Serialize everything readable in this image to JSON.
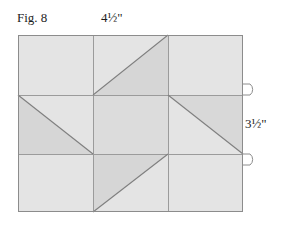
{
  "figure": {
    "caption": "Fig. 8",
    "top_dimension": "4½\"",
    "right_dimension": "3½\"",
    "type": "quilt-block-piecing-diagram"
  },
  "colors": {
    "outline": "#8a8a8a",
    "grid_line": "#9a9a9a",
    "diagonal_line": "#7d7d7d",
    "fill_light": "#e3e3e3",
    "fill_mid": "#dadada",
    "fill_dark": "#d2d2d2",
    "background": "#ffffff",
    "text": "#1c1c1c"
  },
  "geometry": {
    "block_left": 18,
    "block_top": 35,
    "block_right": 243,
    "block_bottom": 212,
    "v_grid": [
      93,
      168
    ],
    "h_grid": [
      95,
      154
    ],
    "tab_top_y": 95,
    "tab_bottom_y": 154
  },
  "grid": {
    "columns": 3,
    "rows": 3,
    "cells": [
      {
        "name": "cell-r1c1",
        "row": 1,
        "col": 1,
        "diagonal": "none",
        "shade": "light"
      },
      {
        "name": "cell-r1c2",
        "row": 1,
        "col": 2,
        "diagonal": "bl-tr",
        "shade": "split"
      },
      {
        "name": "cell-r1c3",
        "row": 1,
        "col": 3,
        "diagonal": "none",
        "shade": "light"
      },
      {
        "name": "cell-r2c1",
        "row": 2,
        "col": 1,
        "diagonal": "tl-br",
        "shade": "split"
      },
      {
        "name": "cell-r2c2",
        "row": 2,
        "col": 2,
        "diagonal": "none",
        "shade": "mid"
      },
      {
        "name": "cell-r2c3",
        "row": 2,
        "col": 3,
        "diagonal": "tl-br",
        "shade": "split"
      },
      {
        "name": "cell-r3c1",
        "row": 3,
        "col": 1,
        "diagonal": "none",
        "shade": "light"
      },
      {
        "name": "cell-r3c2",
        "row": 3,
        "col": 2,
        "diagonal": "bl-tr",
        "shade": "split"
      },
      {
        "name": "cell-r3c3",
        "row": 3,
        "col": 3,
        "diagonal": "none",
        "shade": "light"
      }
    ]
  },
  "dimension_tabs": [
    {
      "name": "dimension-tab-top",
      "position": "right-edge-upper"
    },
    {
      "name": "dimension-tab-bottom",
      "position": "right-edge-lower"
    }
  ]
}
